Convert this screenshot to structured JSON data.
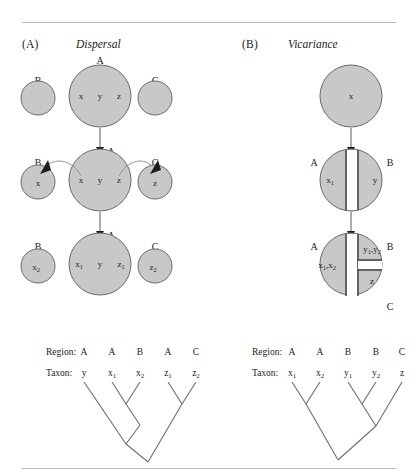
{
  "figure": {
    "background": "#ffffff",
    "circle_fill": "#c8c8c8",
    "circle_stroke": "#6b6b6b",
    "line_color": "#5a5a5a",
    "rule_color": "#b8b8b8"
  },
  "panels": [
    {
      "tag": "(A)",
      "title": "Dispersal",
      "stages": [
        {
          "name": "initial",
          "circles": [
            {
              "region": "B",
              "contents": []
            },
            {
              "region": "A",
              "contents": [
                "x",
                "y",
                "z"
              ]
            },
            {
              "region": "C",
              "contents": []
            }
          ]
        },
        {
          "name": "dispersal",
          "arrow_label": "A",
          "circles": [
            {
              "region": "B",
              "contents": [
                "x"
              ]
            },
            {
              "region": "A",
              "contents": [
                "x",
                "y",
                "z"
              ]
            },
            {
              "region": "C",
              "contents": [
                "z"
              ]
            }
          ]
        },
        {
          "name": "speciation",
          "arrow_label": "A",
          "circles": [
            {
              "region": "B",
              "contents": [
                "x2"
              ]
            },
            {
              "region": "A",
              "contents": [
                "x1",
                "y",
                "z1"
              ]
            },
            {
              "region": "C",
              "contents": [
                "z2"
              ]
            }
          ]
        }
      ],
      "table": {
        "region_key": "Region:",
        "taxon_key": "Taxon:",
        "regions": [
          "A",
          "A",
          "B",
          "A",
          "C"
        ],
        "taxa": [
          "y",
          "x1",
          "x2",
          "z1",
          "z2"
        ]
      },
      "cladogram": {
        "tips": [
          "y",
          "x1",
          "x2",
          "z1",
          "z2"
        ],
        "topology": "(y,(x1,x2)),(z1,z2)"
      }
    },
    {
      "tag": "(B)",
      "title": "Vicariance",
      "stages": [
        {
          "name": "initial",
          "circles": [
            {
              "region": "",
              "contents": [
                "x"
              ]
            }
          ]
        },
        {
          "name": "first-split",
          "arrow_label": "",
          "circles": [
            {
              "region": "A",
              "contents": [
                "x1"
              ]
            },
            {
              "region": "B",
              "contents": [
                "y"
              ]
            }
          ]
        },
        {
          "name": "second-split",
          "arrow_label": "",
          "circles": [
            {
              "region": "A",
              "contents": [
                "x1,x2"
              ]
            },
            {
              "region": "B",
              "contents": [
                "y1,y2"
              ]
            },
            {
              "region": "C",
              "contents": [
                "z"
              ]
            }
          ]
        }
      ],
      "table": {
        "region_key": "Region:",
        "taxon_key": "Taxon:",
        "regions": [
          "A",
          "A",
          "B",
          "B",
          "C"
        ],
        "taxa": [
          "x1",
          "x2",
          "y1",
          "y2",
          "z"
        ]
      },
      "cladogram": {
        "tips": [
          "x1",
          "x2",
          "y1",
          "y2",
          "z"
        ],
        "topology": "((x1,x2),((y1,y2),z))"
      }
    }
  ],
  "labels": {
    "panel_a_tag": "(A)",
    "panel_a_title": "Dispersal",
    "panel_b_tag": "(B)",
    "panel_b_title": "Vicariance",
    "region_key_a": "Region:",
    "taxon_key_a": "Taxon:",
    "region_key_b": "Region:",
    "taxon_key_b": "Taxon:",
    "a_r1": "A",
    "a_r2": "A",
    "a_r3": "B",
    "a_r4": "A",
    "a_r5": "C",
    "b_r1": "A",
    "b_r2": "A",
    "b_r3": "B",
    "b_r4": "B",
    "b_r5": "C"
  }
}
